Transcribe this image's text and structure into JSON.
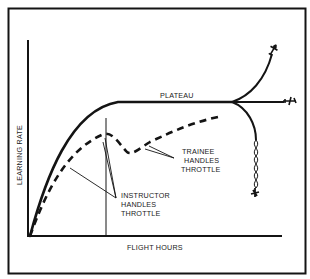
{
  "diagram": {
    "type": "learning-curve",
    "colors": {
      "ink": "#141414",
      "background": "#ffffff"
    },
    "axes": {
      "x_label": "FLIGHT HOURS",
      "y_label": "LEARNING RATE"
    },
    "labels": {
      "plateau": "PLATEAU",
      "trainee": [
        "TRAINEE",
        "HANDLES",
        "THROTTLE"
      ],
      "instructor": [
        "INSTRUCTOR",
        "HANDLES",
        "THROTTLE"
      ]
    },
    "curves": [
      {
        "name": "solid-learning-curve",
        "style": "solid",
        "description": "Rises and levels off at plateau, then branches"
      },
      {
        "name": "dashed-learning-curve",
        "style": "dashed",
        "description": "Rises, dips when trainee takes throttle, rises again"
      }
    ],
    "branches": [
      {
        "name": "upward-branch",
        "end_icon": "airplane-climbing-icon"
      },
      {
        "name": "level-branch",
        "end_icon": "airplane-level-icon"
      },
      {
        "name": "downward-branch",
        "end_icon": "airplane-spin-crash-icon"
      }
    ]
  }
}
